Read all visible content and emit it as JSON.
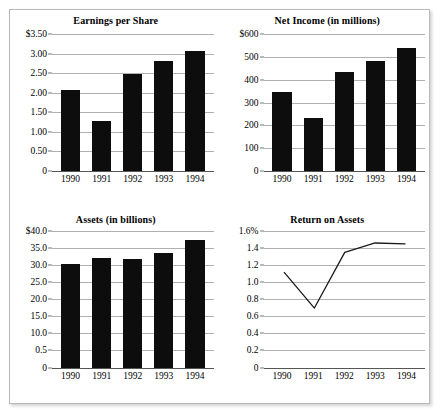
{
  "chart_data": [
    {
      "id": "earnings-per-share",
      "type": "bar",
      "title": "Earnings per Share",
      "xlabel": "",
      "ylabel": "",
      "categories": [
        "1990",
        "1991",
        "1992",
        "1993",
        "1994"
      ],
      "values": [
        2.08,
        1.29,
        2.47,
        2.81,
        3.07
      ],
      "ylim": [
        0,
        3.5
      ],
      "yticks": [
        0,
        0.5,
        1.0,
        1.5,
        2.0,
        2.5,
        3.0,
        3.5
      ],
      "ytick_labels": [
        "0",
        "0.50",
        "1.00",
        "1.50",
        "2.00",
        "2.50",
        "3.00",
        "$3.50"
      ],
      "grid": true,
      "legend": "none",
      "bar_color": "#0d0d0d"
    },
    {
      "id": "net-income",
      "type": "bar",
      "title": "Net Income (in millions)",
      "xlabel": "",
      "ylabel": "",
      "categories": [
        "1990",
        "1991",
        "1992",
        "1993",
        "1994"
      ],
      "values": [
        345,
        230,
        435,
        480,
        540
      ],
      "ylim": [
        0,
        600
      ],
      "yticks": [
        0,
        100,
        200,
        300,
        400,
        500,
        600
      ],
      "ytick_labels": [
        "0",
        "100",
        "200",
        "300",
        "400",
        "500",
        "$600"
      ],
      "grid": true,
      "legend": "none",
      "bar_color": "#0d0d0d"
    },
    {
      "id": "assets",
      "type": "bar",
      "title": "Assets (in billions)",
      "xlabel": "",
      "ylabel": "",
      "categories": [
        "1990",
        "1991",
        "1992",
        "1993",
        "1994"
      ],
      "values": [
        30.2,
        32.0,
        31.6,
        33.4,
        37.2
      ],
      "ylim": [
        0,
        40
      ],
      "yticks": [
        0,
        5,
        10,
        15,
        20,
        25,
        30,
        35,
        40
      ],
      "ytick_labels": [
        "0",
        "0.5",
        "10.0",
        "15.0",
        "20.0",
        "25.0",
        "30.0",
        "35.0",
        "$40.0"
      ],
      "grid": true,
      "legend": "none",
      "bar_color": "#0d0d0d"
    },
    {
      "id": "return-on-assets",
      "type": "line",
      "title": "Return on Assets",
      "xlabel": "",
      "ylabel": "",
      "categories": [
        "1990",
        "1991",
        "1992",
        "1993",
        "1994"
      ],
      "values": [
        1.12,
        0.7,
        1.35,
        1.46,
        1.45
      ],
      "ylim": [
        0,
        1.6
      ],
      "yticks": [
        0,
        0.2,
        0.4,
        0.6,
        0.8,
        1.0,
        1.2,
        1.4,
        1.6
      ],
      "ytick_labels": [
        "0",
        "0.2",
        "0.4",
        "0.6",
        "0.8",
        "1.0",
        "1.2",
        "1.4",
        "1.6%"
      ],
      "grid": true,
      "legend": "none",
      "line_color": "#1a1a1a"
    }
  ]
}
